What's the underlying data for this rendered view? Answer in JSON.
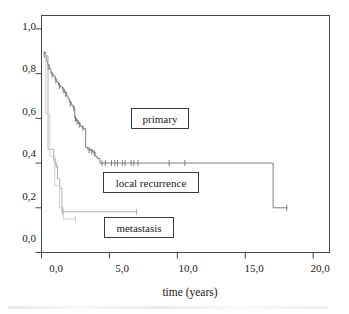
{
  "chart_data": {
    "type": "line",
    "title": "",
    "xlabel": "time (years)",
    "ylabel": "",
    "xlim": [
      0,
      21.2
    ],
    "ylim": [
      0,
      1.06
    ],
    "grid": false,
    "legend_position": "inside-plot-boxes",
    "x_ticks": [
      0,
      5,
      10,
      15,
      20
    ],
    "x_tick_labels": [
      "0,0",
      "5,0",
      "10,0",
      "15,0",
      "20,0"
    ],
    "y_ticks": [
      0.0,
      0.2,
      0.4,
      0.6,
      0.8,
      1.0
    ],
    "y_tick_labels": [
      "0,0",
      "0,2",
      "0,4",
      "0,6",
      "0,8",
      "1,0"
    ],
    "series": [
      {
        "name": "primary",
        "color": "#6e6e6e",
        "step": "post",
        "points": [
          [
            0.15,
            0.895
          ],
          [
            0.3,
            0.875
          ],
          [
            0.38,
            0.855
          ],
          [
            0.45,
            0.84
          ],
          [
            0.58,
            0.82
          ],
          [
            0.7,
            0.8
          ],
          [
            0.85,
            0.79
          ],
          [
            1.0,
            0.775
          ],
          [
            1.12,
            0.762
          ],
          [
            1.25,
            0.748
          ],
          [
            1.4,
            0.74
          ],
          [
            1.55,
            0.73
          ],
          [
            1.7,
            0.715
          ],
          [
            1.85,
            0.7
          ],
          [
            1.95,
            0.688
          ],
          [
            2.05,
            0.672
          ],
          [
            2.2,
            0.66
          ],
          [
            2.32,
            0.648
          ],
          [
            2.45,
            0.6
          ],
          [
            2.58,
            0.59
          ],
          [
            2.7,
            0.578
          ],
          [
            2.85,
            0.565
          ],
          [
            3.0,
            0.558
          ],
          [
            3.1,
            0.555
          ],
          [
            3.25,
            0.47
          ],
          [
            3.4,
            0.462
          ],
          [
            3.6,
            0.455
          ],
          [
            3.8,
            0.448
          ],
          [
            3.95,
            0.43
          ],
          [
            4.1,
            0.42
          ],
          [
            4.3,
            0.4
          ],
          [
            17.0,
            0.4
          ],
          [
            17.05,
            0.2
          ],
          [
            18.1,
            0.2
          ]
        ],
        "censor_marks": [
          [
            0.22,
            0.885
          ],
          [
            0.5,
            0.83
          ],
          [
            0.78,
            0.795
          ],
          [
            1.05,
            0.77
          ],
          [
            1.32,
            0.745
          ],
          [
            1.6,
            0.725
          ],
          [
            1.78,
            0.708
          ],
          [
            2.12,
            0.665
          ],
          [
            2.38,
            0.645
          ],
          [
            2.5,
            0.598
          ],
          [
            2.62,
            0.585
          ],
          [
            2.78,
            0.572
          ],
          [
            3.05,
            0.556
          ],
          [
            3.5,
            0.458
          ],
          [
            3.7,
            0.452
          ],
          [
            3.88,
            0.445
          ],
          [
            4.45,
            0.4
          ],
          [
            4.7,
            0.4
          ],
          [
            5.15,
            0.4
          ],
          [
            5.4,
            0.4
          ],
          [
            5.6,
            0.4
          ],
          [
            5.95,
            0.4
          ],
          [
            6.15,
            0.4
          ],
          [
            6.6,
            0.4
          ],
          [
            6.8,
            0.4
          ],
          [
            7.1,
            0.4
          ],
          [
            9.4,
            0.4
          ],
          [
            10.55,
            0.4
          ],
          [
            18.05,
            0.2
          ]
        ]
      },
      {
        "name": "local recurrence",
        "color": "#a8a8a8",
        "step": "post",
        "points": [
          [
            0.12,
            0.88
          ],
          [
            0.45,
            0.88
          ],
          [
            0.48,
            0.462
          ],
          [
            0.88,
            0.462
          ],
          [
            0.9,
            0.42
          ],
          [
            1.0,
            0.42
          ],
          [
            1.02,
            0.39
          ],
          [
            1.15,
            0.39
          ],
          [
            1.18,
            0.33
          ],
          [
            1.32,
            0.33
          ],
          [
            1.35,
            0.288
          ],
          [
            1.48,
            0.288
          ],
          [
            1.5,
            0.182
          ],
          [
            7.05,
            0.182
          ]
        ],
        "censor_marks": [
          [
            0.92,
            0.42
          ],
          [
            1.08,
            0.39
          ],
          [
            1.55,
            0.182
          ],
          [
            7.0,
            0.182
          ]
        ]
      },
      {
        "name": "metastasis",
        "color": "#cccccc",
        "step": "post",
        "points": [
          [
            0.1,
            0.885
          ],
          [
            0.3,
            0.885
          ],
          [
            0.32,
            0.62
          ],
          [
            0.6,
            0.62
          ],
          [
            0.62,
            0.43
          ],
          [
            0.95,
            0.43
          ],
          [
            0.98,
            0.3
          ],
          [
            1.3,
            0.3
          ],
          [
            1.32,
            0.2
          ],
          [
            1.6,
            0.2
          ],
          [
            1.62,
            0.15
          ],
          [
            2.55,
            0.15
          ]
        ],
        "censor_marks": [
          [
            2.5,
            0.15
          ]
        ]
      }
    ]
  },
  "axis": {
    "x_title": "time (years)",
    "y_tick_labels": [
      "1,0",
      "0,8",
      "0,6",
      "0,4",
      "0,2",
      "0,0"
    ],
    "x_tick_labels": [
      "0,0",
      "5,0",
      "10,0",
      "15,0",
      "20,0"
    ]
  },
  "legend": {
    "primary": "primary",
    "local_recurrence": "local recurrence",
    "metastasis": "metastasis"
  },
  "colors": {
    "frame": "#444444",
    "primary": "#6e6e6e",
    "local_recurrence": "#a8a8a8",
    "metastasis": "#cccccc",
    "text": "#1a1a1a",
    "background": "#ffffff"
  }
}
